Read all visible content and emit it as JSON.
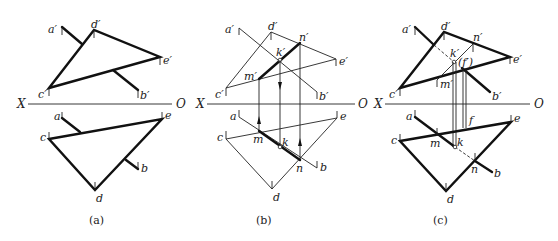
{
  "figure": {
    "axis_labels": {
      "x": "X",
      "o": "O"
    },
    "panels": [
      {
        "id": "a",
        "caption": "(a)",
        "labels": {
          "a1": "a′",
          "d1": "d′",
          "e1": "e′",
          "c1": "c′",
          "b1": "b′",
          "a": "a",
          "e": "e",
          "c": "c",
          "b": "b",
          "d": "d"
        }
      },
      {
        "id": "b",
        "caption": "(b)",
        "labels": {
          "a1": "a′",
          "d1": "d′",
          "n1": "n′",
          "k1": "k′",
          "e1": "e′",
          "m1": "m′",
          "c1": "c′",
          "b1": "b′",
          "a": "a",
          "e": "e",
          "c": "c",
          "m": "m",
          "k": "k",
          "n": "n",
          "b": "b",
          "d": "d"
        }
      },
      {
        "id": "c",
        "caption": "(c)",
        "labels": {
          "a1": "a′",
          "d1": "d′",
          "n1": "n′",
          "k1": "k′",
          "f1": "(f′)",
          "e1": "e′",
          "m1": "m′",
          "c1": "c′",
          "b1": "b′",
          "a": "a",
          "f": "f",
          "e": "e",
          "c": "c",
          "m": "m",
          "k": "k",
          "n": "n",
          "b": "b",
          "d": "d"
        }
      }
    ]
  }
}
